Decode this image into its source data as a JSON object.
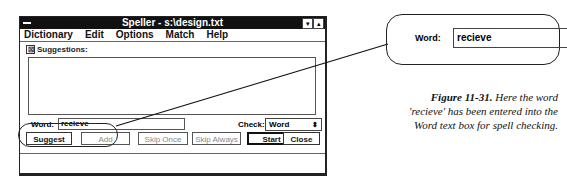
{
  "window": {
    "title": "Speller - s:\\design.txt",
    "system_menu_icon": "system-menu-icon",
    "minimize_glyph": "▾",
    "maximize_glyph": "▴"
  },
  "menubar": {
    "items": [
      {
        "label": "Dictionary",
        "mnemonic": "D"
      },
      {
        "label": "Edit",
        "mnemonic": "E"
      },
      {
        "label": "Options",
        "mnemonic": "p"
      },
      {
        "label": "Match",
        "mnemonic": "M"
      },
      {
        "label": "Help",
        "mnemonic": "H"
      }
    ]
  },
  "suggestions": {
    "label": "Suggestions:",
    "checked": true,
    "check_glyph": "☒",
    "items": []
  },
  "word": {
    "label": "Word:",
    "value": "recieve"
  },
  "check": {
    "label": "Check:",
    "selected": "Word",
    "arrow_glyph": "⬍"
  },
  "buttons": {
    "suggest": "Suggest",
    "add": "Add",
    "skip_once": "Skip Once",
    "skip_always": "Skip Always",
    "start": "Start",
    "close": "Close"
  },
  "callout": {
    "label": "Word:",
    "value": "recieve"
  },
  "caption": {
    "figure": "Figure 11-31.",
    "text": " Here the word 'recieve' has been entered into the Word text box for spell checking."
  }
}
